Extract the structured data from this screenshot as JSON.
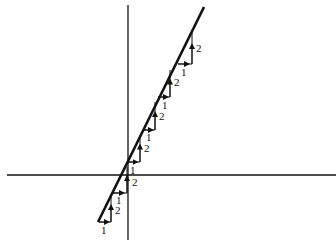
{
  "diagram": {
    "colors": {
      "ink": "#111111",
      "background": "#ffffff"
    },
    "axes": {
      "x_axis": {
        "x1": 7,
        "y1": 175,
        "x2": 336,
        "y2": 175
      },
      "y_axis": {
        "x1": 128,
        "y1": 5,
        "x2": 128,
        "y2": 240
      }
    },
    "main_line": {
      "x1": 98,
      "y1": 222,
      "x2": 204,
      "y2": 7
    },
    "steps": [
      {
        "h": {
          "x1": 99,
          "y": 222,
          "x2": 111
        },
        "v": {
          "x": 111,
          "y1": 222,
          "y2": 196
        },
        "run_label": {
          "text": "1",
          "x": 101,
          "y": 234
        },
        "rise_label": {
          "text": "2",
          "x": 115,
          "y": 214
        }
      },
      {
        "h": {
          "x1": 113,
          "y": 193,
          "x2": 127
        },
        "v": {
          "x": 127,
          "y1": 193,
          "y2": 167
        },
        "run_label": {
          "text": "1",
          "x": 116,
          "y": 204
        },
        "rise_label": {
          "text": "2",
          "x": 132,
          "y": 186
        }
      },
      {
        "h": {
          "x1": 127,
          "y": 162,
          "x2": 140
        },
        "v": {
          "x": 140,
          "y1": 162,
          "y2": 135
        },
        "run_label": {
          "text": "1",
          "x": 130,
          "y": 174
        },
        "rise_label": {
          "text": "2",
          "x": 144,
          "y": 152
        }
      },
      {
        "h": {
          "x1": 143,
          "y": 130,
          "x2": 155
        },
        "v": {
          "x": 155,
          "y1": 130,
          "y2": 102
        },
        "run_label": {
          "text": "1",
          "x": 146,
          "y": 141
        },
        "rise_label": {
          "text": "2",
          "x": 159,
          "y": 120
        }
      },
      {
        "h": {
          "x1": 158,
          "y": 97,
          "x2": 170
        },
        "v": {
          "x": 170,
          "y1": 97,
          "y2": 70
        },
        "run_label": {
          "text": "1",
          "x": 162,
          "y": 109
        },
        "rise_label": {
          "text": "2",
          "x": 174,
          "y": 86
        }
      },
      {
        "h": {
          "x1": 178,
          "y": 64,
          "x2": 192
        },
        "v": {
          "x": 192,
          "y1": 64,
          "y2": 32
        },
        "run_label": {
          "text": "1",
          "x": 181,
          "y": 76
        },
        "rise_label": {
          "text": "2",
          "x": 196,
          "y": 52
        }
      }
    ]
  }
}
